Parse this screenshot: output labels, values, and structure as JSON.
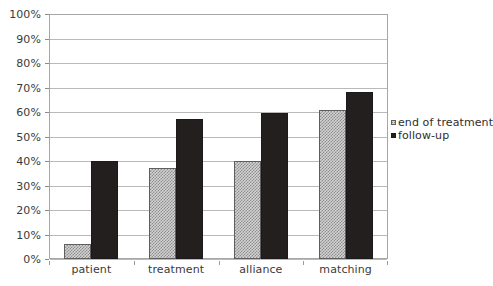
{
  "chart_data": {
    "type": "bar",
    "title": "",
    "subtitle": "",
    "xlabel": "",
    "ylabel": "",
    "categories": [
      "patient",
      "treatment",
      "alliance",
      "matching"
    ],
    "series": [
      {
        "name": "end of treatment",
        "values": [
          6,
          37,
          40,
          61
        ],
        "fill": "light-hatched",
        "color": "#d2d2d2",
        "border_color": "#5e5e5e"
      },
      {
        "name": "follow-up",
        "values": [
          40,
          57,
          59.5,
          68
        ],
        "fill": "solid",
        "color": "#231f1f",
        "border_color": "#1a1a1a"
      }
    ],
    "ylim": [
      0,
      100
    ],
    "y_tick_values": [
      0,
      10,
      20,
      30,
      40,
      50,
      60,
      70,
      80,
      90,
      100
    ],
    "y_tick_labels": [
      "0%",
      "10%",
      "20%",
      "30%",
      "40%",
      "50%",
      "60%",
      "70%",
      "80%",
      "90%",
      "100%"
    ],
    "y_tick_suffix": "%",
    "grid": true,
    "grid_axis": "y",
    "legend": true,
    "legend_position": "right",
    "legend_entries": [
      "end of treatment",
      "follow-up"
    ],
    "background_color": "#ffffff",
    "gridline_color": "#b9b9b9",
    "frame_color": "#a6a6a6",
    "axis_text_color": "#3a3a3a"
  }
}
